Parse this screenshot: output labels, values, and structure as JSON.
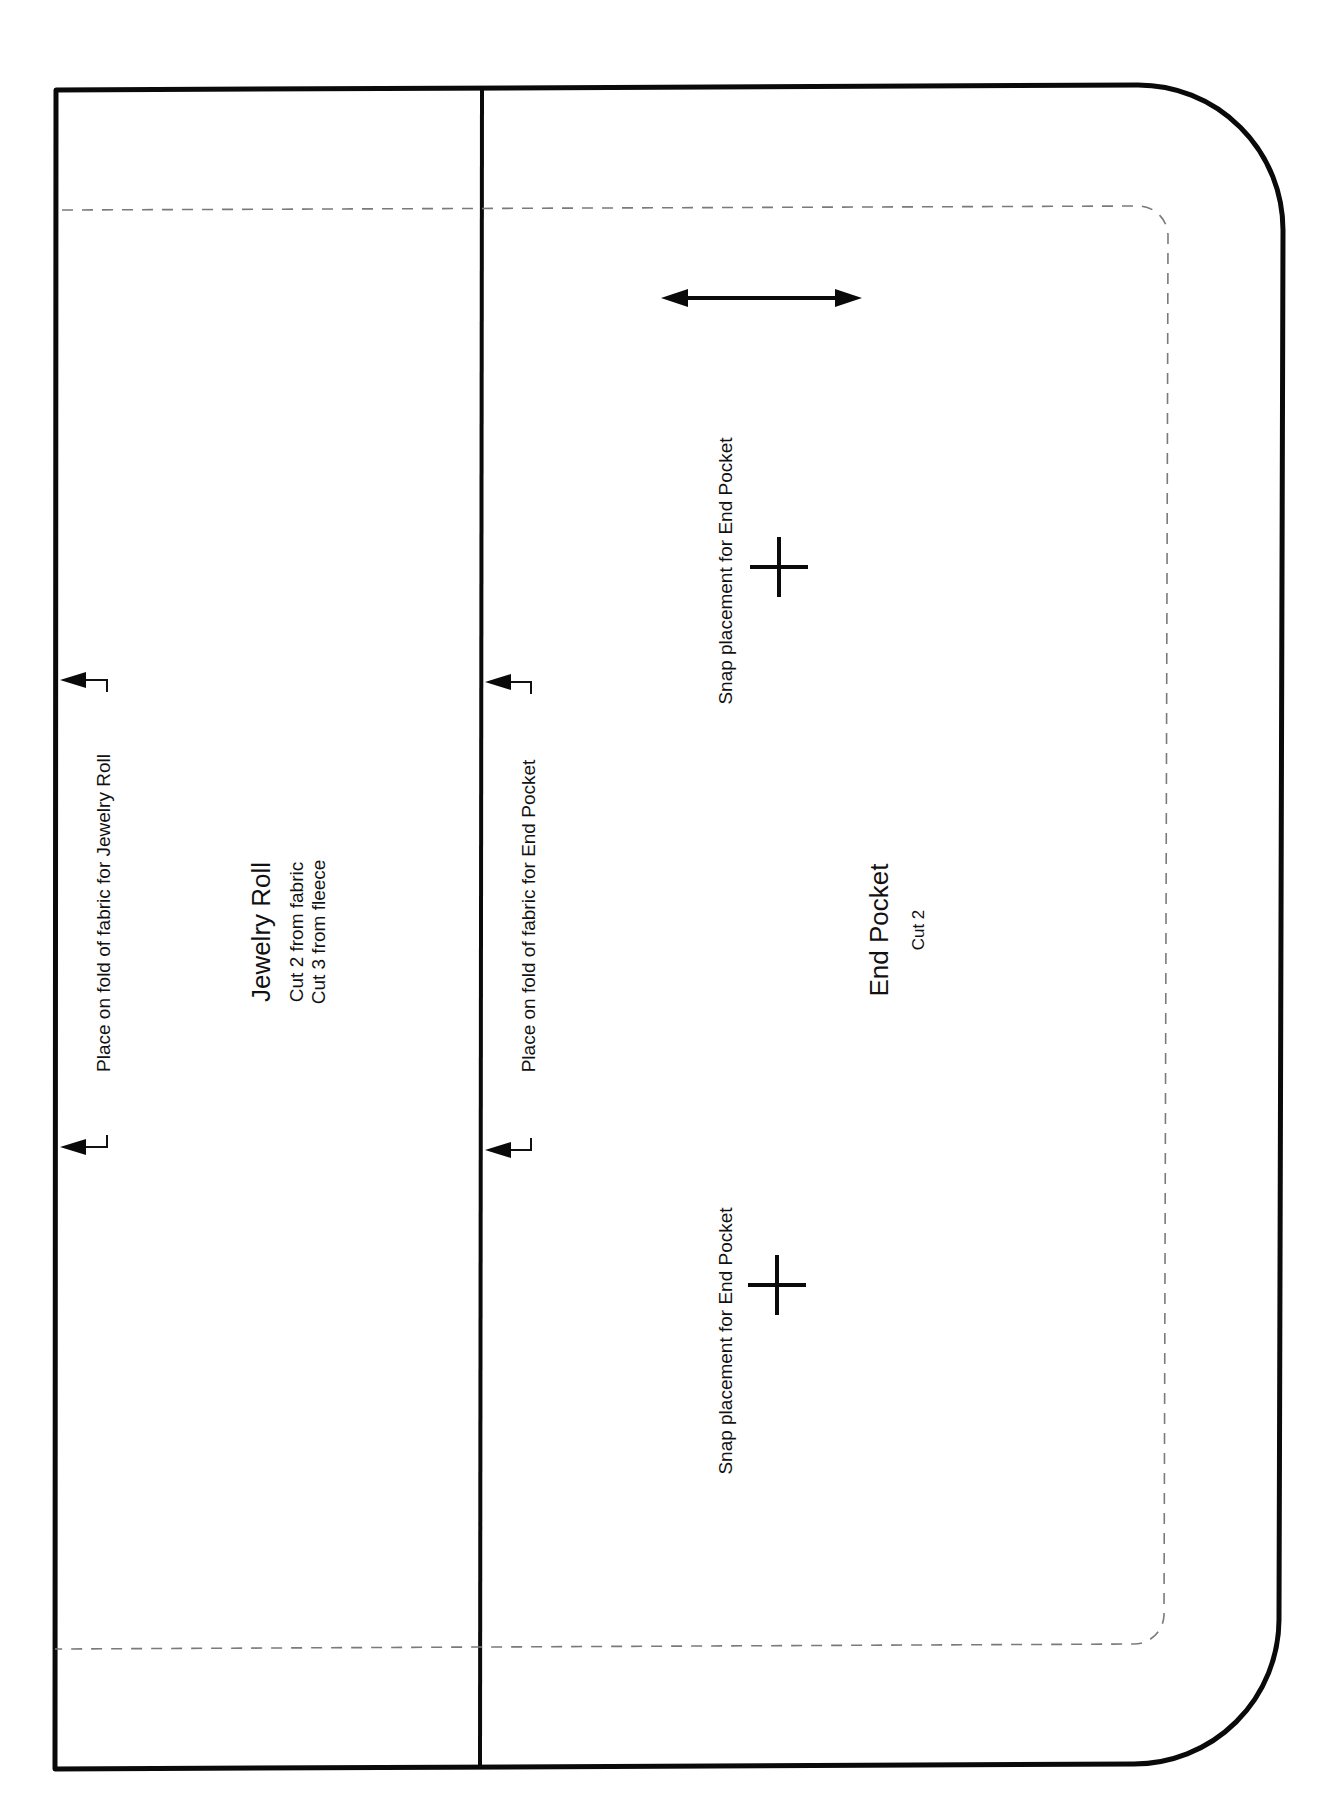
{
  "pattern": {
    "pieces": [
      {
        "id": "jewelry-roll",
        "title": "Jewelry Roll",
        "cut_lines": [
          "Cut 2 from fabric",
          "Cut 3 from fleece"
        ]
      },
      {
        "id": "end-pocket",
        "title": "End Pocket",
        "cut_lines": [
          "Cut 2"
        ]
      }
    ],
    "fold_labels": {
      "jewelry_roll": "Place on fold of fabric for Jewelry Roll",
      "end_pocket": "Place on fold of fabric for End Pocket"
    },
    "snap_labels": [
      "Snap placement for End Pocket",
      "Snap placement for End Pocket"
    ],
    "markers": {
      "grainline": "double-arrow-icon",
      "snap": "plus-icon",
      "fold": "fold-bracket-arrow-icon"
    },
    "colors": {
      "outline": "#0a0a0a",
      "seam_line": "#7a7a7a",
      "background": "#ffffff"
    }
  }
}
